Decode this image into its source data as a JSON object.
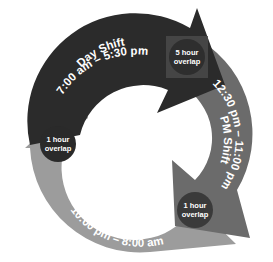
{
  "diagram": {
    "type": "cycle",
    "colors": {
      "day": "#2b2b2b",
      "pm": "#6b6b6b",
      "night": "#9c9c9c",
      "overlap_badge": "#3a3a3a",
      "background": "#ffffff",
      "text": "#ffffff"
    },
    "segments": [
      {
        "id": "day",
        "title": "Day Shift",
        "time": "7:00 am – 5:30 pm"
      },
      {
        "id": "pm",
        "title": "PM Shift",
        "time": "12:30 pm – 11:00 pm"
      },
      {
        "id": "night",
        "title": "Night Shift",
        "time": "10:00 pm – 8:00 am"
      }
    ],
    "overlaps": [
      {
        "id": "day-pm",
        "line1": "5 hour",
        "line2": "overlap"
      },
      {
        "id": "pm-night",
        "line1": "1 hour",
        "line2": "overlap"
      },
      {
        "id": "night-day",
        "line1": "1 hour",
        "line2": "overlap"
      }
    ]
  }
}
